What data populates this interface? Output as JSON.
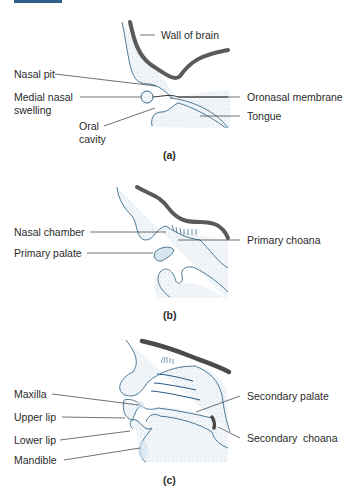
{
  "figure": {
    "panels": [
      {
        "caption": "(a)",
        "labels": {
          "wall_of_brain": "Wall of brain",
          "nasal_pit": "Nasal pit",
          "medial_nasal_swelling_1": "Medial nasal",
          "medial_nasal_swelling_2": "swelling",
          "oral_cavity_1": "Oral",
          "oral_cavity_2": "cavity",
          "oronasal_membrane": "Oronasal membrane",
          "tongue": "Tongue"
        }
      },
      {
        "caption": "(b)",
        "labels": {
          "nasal_chamber": "Nasal chamber",
          "primary_palate": "Primary palate",
          "primary_choana": "Primary choana"
        }
      },
      {
        "caption": "(c)",
        "labels": {
          "maxilla": "Maxilla",
          "upper_lip": "Upper lip",
          "lower_lip": "Lower lip",
          "mandible": "Mandible",
          "secondary_palate": "Secondary palate",
          "secondary_choana": "Secondary  choana"
        }
      }
    ]
  },
  "colors": {
    "outline": "#3a6b8a",
    "brain_wall": "#555555",
    "tissue_fill": "#eef4f8",
    "accent_tab": "#2f5e8c"
  }
}
